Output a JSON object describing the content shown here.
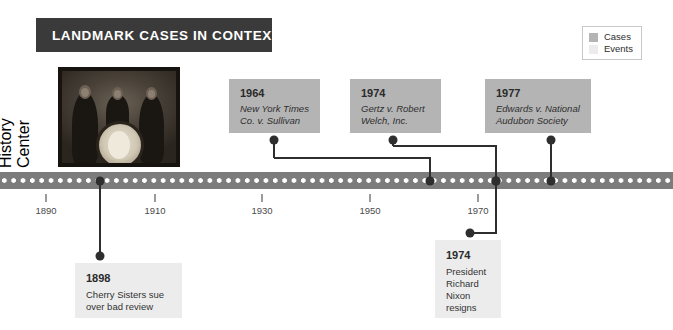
{
  "title": {
    "text": "LANDMARK CASES IN CONTEXT"
  },
  "legend": {
    "items": [
      {
        "label": "Cases",
        "color": "#b4b4b4"
      },
      {
        "label": "Events",
        "color": "#ececec"
      }
    ]
  },
  "photo": {
    "credit_line_1": "Photo courtesy of The",
    "credit_line_2": "History Center",
    "alt": "historical-photo-cherry-sisters"
  },
  "axis": {
    "ticks": [
      {
        "label": "1890",
        "x": 46
      },
      {
        "label": "1910",
        "x": 155
      },
      {
        "label": "1930",
        "x": 262
      },
      {
        "label": "1950",
        "x": 370
      },
      {
        "label": "1970",
        "x": 478
      }
    ]
  },
  "cases": [
    {
      "year": "1964",
      "title_line_1": "New York Times",
      "title_line_2": "Co. v. Sullivan",
      "box_x": 229,
      "box_y": 79,
      "box_w": 91,
      "box_h": 54,
      "stem_x": 274,
      "elbow_x": 430
    },
    {
      "year": "1974",
      "title_line_1": "Gertz v. Robert",
      "title_line_2": "Welch, Inc.",
      "box_x": 350,
      "box_y": 79,
      "box_w": 91,
      "box_h": 54,
      "stem_x": 393,
      "elbow_x": 496
    },
    {
      "year": "1977",
      "title_line_1": "Edwards v. National",
      "title_line_2": "Audubon Society",
      "box_x": 485,
      "box_y": 79,
      "box_w": 106,
      "box_h": 54,
      "stem_x": 551,
      "elbow_x": 551
    }
  ],
  "events": [
    {
      "year": "1898",
      "desc_line_1": "Cherry Sisters sue",
      "desc_line_2": "over bad review",
      "box_x": 75,
      "box_y": 263,
      "box_w": 107,
      "box_h": 55,
      "stem_x": 100,
      "elbow_x": 100
    },
    {
      "year": "1974",
      "desc_line_1": "President",
      "desc_line_2": "Richard",
      "desc_line_3": "Nixon",
      "desc_line_4": "resigns",
      "box_x": 435,
      "box_y": 240,
      "box_w": 66,
      "box_h": 78,
      "stem_x": 496,
      "elbow_x": 470
    }
  ],
  "colors": {
    "banner": "#3a3a3a",
    "timeline_bar": "#7c7c7c",
    "case_box": "#b4b4b4",
    "event_box": "#ececec",
    "connector": "#2e2e2e"
  }
}
